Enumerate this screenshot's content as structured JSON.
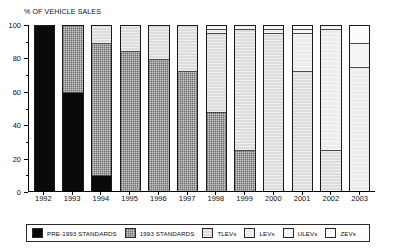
{
  "chart_data": {
    "type": "bar",
    "title": "% OF VEHICLE SALES",
    "xlabel": "",
    "ylabel": "% OF VEHICLE SALES",
    "ylim": [
      0,
      100
    ],
    "yticks": [
      0,
      20,
      40,
      60,
      80,
      100
    ],
    "ytick_labels": [
      "0",
      "20",
      "40",
      "60",
      "80",
      "100"
    ],
    "grid": false,
    "stacked": true,
    "legend_position": "bottom",
    "categories": [
      "1992",
      "1993",
      "1994",
      "1995",
      "1996",
      "1997",
      "1998",
      "1999",
      "2000",
      "2001",
      "2002",
      "2003"
    ],
    "series": [
      {
        "name": "PRE-1993 STANDARDS",
        "key": "pre93",
        "color": "#0a0a0a",
        "values": [
          100,
          60,
          10,
          0,
          0,
          0,
          0,
          0,
          0,
          0,
          0,
          0
        ]
      },
      {
        "name": "1993 STANDARDS",
        "key": "std93",
        "color": "#9a9a9a",
        "values": [
          0,
          40,
          80,
          85,
          80,
          73,
          48,
          25,
          0,
          0,
          0,
          0
        ]
      },
      {
        "name": "TLEVs",
        "key": "tlev",
        "color": "#dcdcdc",
        "values": [
          0,
          0,
          10,
          15,
          20,
          27,
          48,
          73,
          96,
          73,
          25,
          0
        ]
      },
      {
        "name": "LEVs",
        "key": "lev",
        "color": "#ececec",
        "values": [
          0,
          0,
          0,
          0,
          0,
          0,
          2,
          0,
          2,
          23,
          73,
          75
        ]
      },
      {
        "name": "ULEVs",
        "key": "ulev",
        "color": "#f4f4f4",
        "values": [
          0,
          0,
          0,
          0,
          0,
          0,
          2,
          2,
          2,
          2,
          2,
          15
        ]
      },
      {
        "name": "ZEVs",
        "key": "zev",
        "color": "#fbfbfb",
        "values": [
          0,
          0,
          0,
          0,
          0,
          0,
          0,
          0,
          0,
          2,
          0,
          10
        ]
      }
    ],
    "legend": [
      {
        "label": "PRE-1993 STANDARDS",
        "swatch": "pre93"
      },
      {
        "label": "1993 STANDARDS",
        "swatch": "std93"
      },
      {
        "label": "TLEVs",
        "swatch": "tlev"
      },
      {
        "label": "LEVs",
        "swatch": "lev"
      },
      {
        "label": "ULEVs",
        "swatch": "ulev"
      },
      {
        "label": "ZEVs",
        "swatch": "zev"
      }
    ]
  }
}
